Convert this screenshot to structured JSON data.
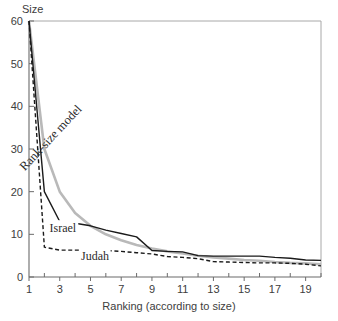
{
  "chart_data": {
    "type": "line",
    "title": "",
    "subtitle": "",
    "xlabel": "Ranking (according to size)",
    "ylabel": "Size",
    "xlim": [
      1,
      20
    ],
    "ylim": [
      0,
      60
    ],
    "ygrid": false,
    "xgrid": false,
    "legend_position": "inline-annotations",
    "ytick_labels": [
      "0",
      "10",
      "20",
      "30",
      "40",
      "50",
      "60"
    ],
    "ytick_values": [
      0,
      10,
      20,
      30,
      40,
      50,
      60
    ],
    "xtick_labels": [
      "1",
      "3",
      "5",
      "7",
      "9",
      "11",
      "13",
      "15",
      "17",
      "19"
    ],
    "xtick_values": [
      1,
      3,
      5,
      7,
      9,
      11,
      13,
      15,
      17,
      19
    ],
    "xtick_minor_values": [
      2,
      4,
      6,
      8,
      10,
      12,
      14,
      16,
      18,
      20
    ],
    "x": [
      1,
      2,
      3,
      4,
      5,
      6,
      7,
      8,
      9,
      10,
      11,
      12,
      13,
      14,
      15,
      16,
      17,
      18,
      19,
      20
    ],
    "series": [
      {
        "name": "Rank-size model",
        "style": "solid",
        "color": "#b9b9b9",
        "width": 2.6,
        "label_rotation": -47,
        "values": [
          60,
          30,
          20,
          15,
          12,
          10,
          8.6,
          7.5,
          6.7,
          6,
          5.5,
          5,
          4.6,
          4.3,
          4,
          3.8,
          3.5,
          3.3,
          3.2,
          3
        ]
      },
      {
        "name": "Israel",
        "style": "solid",
        "color": "#1a1a1a",
        "width": 1.4,
        "values": [
          60,
          20,
          13,
          12.6,
          12,
          11,
          10.2,
          9.4,
          6.2,
          6,
          5.9,
          5,
          4.9,
          4.9,
          4.9,
          4.9,
          4.6,
          4.4,
          4,
          3.9
        ]
      },
      {
        "name": "Judah",
        "style": "dashed",
        "color": "#1a1a1a",
        "width": 1.4,
        "values": [
          60,
          7,
          6.3,
          6.3,
          6.3,
          6.2,
          6,
          5.7,
          5.4,
          4.8,
          4.6,
          4.3,
          3.6,
          3.5,
          3.4,
          3.3,
          3.3,
          3.2,
          3,
          2.6
        ]
      }
    ],
    "annotations": [
      {
        "text": "Rank-size model",
        "x": 2.6,
        "y": 32,
        "rotation": -47,
        "series": "Rank-size model"
      },
      {
        "text": "Israel",
        "x": 3.2,
        "y": 10.6,
        "rotation": 0,
        "series": "Israel"
      },
      {
        "text": "Judah",
        "x": 5.3,
        "y": 3.9,
        "rotation": 0,
        "series": "Judah"
      }
    ]
  },
  "axes": {
    "y_title": "Size",
    "x_title": "Ranking (according to size)"
  },
  "colors": {
    "axis": "#6b6b6b",
    "text": "#3d3d3d",
    "israel": "#1a1a1a",
    "judah": "#1a1a1a",
    "model": "#b9b9b9",
    "background": "#ffffff"
  }
}
